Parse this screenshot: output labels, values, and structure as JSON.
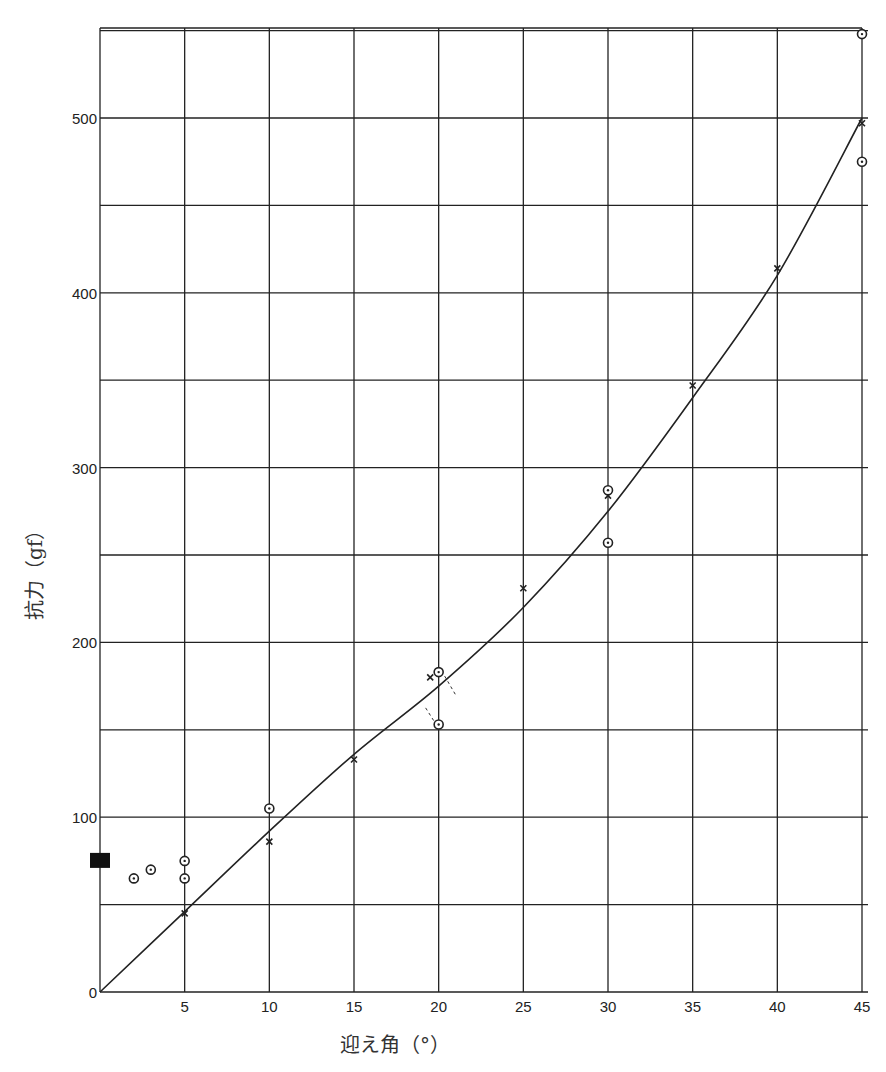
{
  "chart_data": {
    "type": "scatter",
    "title": "",
    "xlabel": "迎え角（°）",
    "ylabel": "抗力（gf）",
    "xlim": [
      0,
      45
    ],
    "ylim": [
      0,
      550
    ],
    "grid": true,
    "x_ticks": [
      5,
      10,
      15,
      20,
      25,
      30,
      35,
      40,
      45
    ],
    "y_ticks": [
      0,
      100,
      200,
      300,
      400,
      500
    ],
    "x_grid_step": 5,
    "y_grid_step": 50,
    "series": [
      {
        "name": "x-markers",
        "marker": "x",
        "points": [
          [
            5,
            45
          ],
          [
            10,
            86
          ],
          [
            15,
            133
          ],
          [
            19.5,
            180
          ],
          [
            25,
            231
          ],
          [
            30,
            284
          ],
          [
            35,
            347
          ],
          [
            40,
            414
          ],
          [
            45,
            497
          ]
        ]
      },
      {
        "name": "circle-markers",
        "marker": "circle-dot",
        "points": [
          [
            2,
            65
          ],
          [
            3,
            70
          ],
          [
            5,
            75
          ],
          [
            5,
            65
          ],
          [
            10,
            105
          ],
          [
            20,
            183
          ],
          [
            20,
            153
          ],
          [
            30,
            287
          ],
          [
            30,
            257
          ],
          [
            45,
            475
          ],
          [
            45,
            548
          ]
        ]
      },
      {
        "name": "filled-square",
        "marker": "square",
        "points": [
          [
            0,
            75
          ]
        ]
      },
      {
        "name": "fit-curve",
        "marker": "line",
        "points": [
          [
            0,
            0
          ],
          [
            5,
            46
          ],
          [
            10,
            92
          ],
          [
            15,
            136
          ],
          [
            20,
            175
          ],
          [
            25,
            220
          ],
          [
            30,
            275
          ],
          [
            35,
            340
          ],
          [
            40,
            410
          ],
          [
            45,
            500
          ]
        ]
      }
    ],
    "annotations": [
      "dashed connectors from circles at 20° to the curve"
    ]
  }
}
